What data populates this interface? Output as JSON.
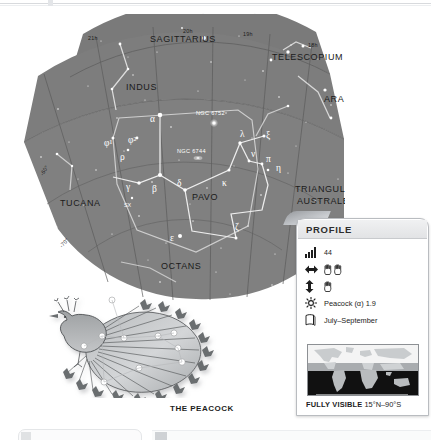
{
  "page": {
    "watermark_text": "www.example.com  ·  sample"
  },
  "star_chart": {
    "constellations": [
      {
        "name": "SAGITTARIUS",
        "x": 197,
        "y": 26
      },
      {
        "name": "TELESCOPIUM",
        "x": 317,
        "y": 42
      },
      {
        "name": "INDUS",
        "x": 146,
        "y": 74
      },
      {
        "name": "ARA",
        "x": 344,
        "y": 85
      },
      {
        "name": "PAVO",
        "x": 208,
        "y": 182
      },
      {
        "name": "TUCANA",
        "x": 86,
        "y": 189
      },
      {
        "name": "TRIANGULUM",
        "x": 337,
        "y": 175
      },
      {
        "name": "AUSTRALE",
        "x": 337,
        "y": 187
      },
      {
        "name": "OCTANS",
        "x": 184,
        "y": 252
      }
    ],
    "ra_labels": [
      "21h",
      "20h",
      "19h",
      "18h"
    ],
    "dec_labels": [
      "-60°",
      "-70°"
    ],
    "star_labels": [
      "α",
      "φ¹",
      "φ²",
      "ρ",
      "γ",
      "β",
      "δ",
      "κ",
      "λ",
      "ν",
      "ξ",
      "π",
      "η",
      "ε",
      "ζ",
      "SX"
    ],
    "deep_sky": [
      "NGC 6752",
      "NGC 6744"
    ]
  },
  "illustration": {
    "caption": "THE PEACOCK",
    "figure_name": "peacock"
  },
  "profile": {
    "title": "PROFILE",
    "rows": [
      {
        "icon": "bar-chart-icon",
        "label": "44",
        "type": "text"
      },
      {
        "icon": "width-arrows-icon",
        "label": "",
        "type": "hands",
        "hands": 2
      },
      {
        "icon": "height-arrows-icon",
        "label": "",
        "type": "hands",
        "hands": 1
      },
      {
        "icon": "star-burst-icon",
        "label": "Peacock (α) 1.9",
        "type": "text"
      },
      {
        "icon": "calendar-page-icon",
        "label": "July–September",
        "type": "text"
      }
    ],
    "visibility": {
      "prefix": "FULLY VISIBLE",
      "range": "15°N–90°S"
    }
  },
  "bottom_panels": {
    "right_text": " "
  },
  "colors": {
    "sky": "#7d7d7d",
    "sky_light": "#8a8a8a",
    "grid": "#5d5d5d",
    "constellation_line": "#e9e9e9",
    "panel_border": "#b9bcc0",
    "text_dark": "#1c1c1c"
  }
}
